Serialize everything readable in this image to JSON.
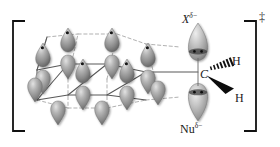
{
  "figure": {
    "kind": "chemistry-transition-state-diagram",
    "bracket_left": "[",
    "bracket_right": "]",
    "transition_state_marker": "‡",
    "labels": {
      "leaving_group": {
        "symbol": "X",
        "charge": "δ−"
      },
      "nucleophile": {
        "symbol": "Nu",
        "charge": "δ−"
      },
      "central_atom": "C",
      "hydrogen_top": "H",
      "hydrogen_bottom": "H"
    },
    "colors": {
      "orbital_fill": "#8d8d8d",
      "orbital_highlight": "#d9d9d9",
      "orbital_shadow": "#5d5d5d",
      "electron_dot": "#1a1a1a",
      "bond_solid": "#4a4a4a",
      "bond_dashed": "#9a9a9a",
      "bracket": "#1a1a1a",
      "text": "#1a1a1a",
      "background": "#ffffff"
    },
    "lattice": {
      "description": "hexagonal sp3 orbital lattice",
      "rows": 3,
      "orbital_count": 16,
      "electron_dot_count": 6
    },
    "wedges": {
      "hashed_wedge_to": "H",
      "solid_wedge_to": "H",
      "hash_count": 7
    }
  }
}
